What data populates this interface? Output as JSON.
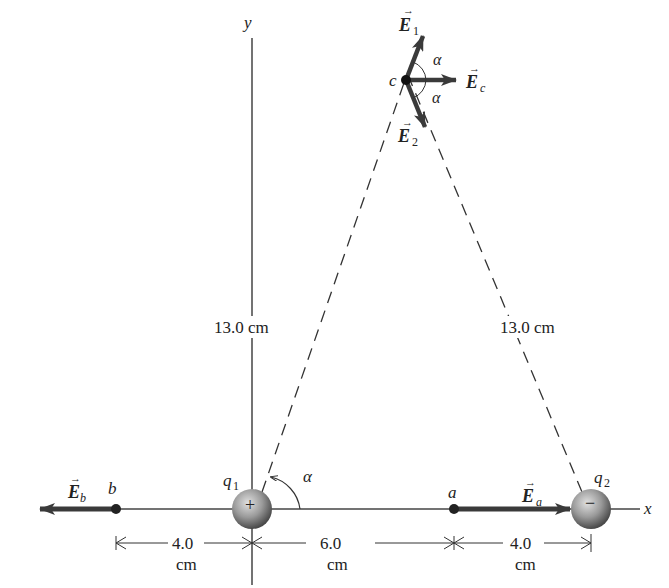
{
  "axes": {
    "x_label": "x",
    "y_label": "y"
  },
  "charges": {
    "q1": {
      "label": "q",
      "subscript": "1",
      "sign": "+"
    },
    "q2": {
      "label": "q",
      "subscript": "2",
      "sign": "−"
    }
  },
  "points": {
    "a": "a",
    "b": "b",
    "c": "c"
  },
  "vectors": {
    "E1": {
      "base": "E",
      "sub": "1"
    },
    "E2": {
      "base": "E",
      "sub": "2"
    },
    "Ec": {
      "base": "E",
      "sub": "c"
    },
    "Ea": {
      "base": "E",
      "sub": "a"
    },
    "Eb": {
      "base": "E",
      "sub": "b"
    },
    "arrow_glyph": "→"
  },
  "angles": {
    "alpha": "α"
  },
  "distances": {
    "left_dashed": "13.0 cm",
    "right_dashed": "13.0 cm",
    "b_to_q1_value": "4.0",
    "q1_to_a_value": "6.0",
    "a_to_q2_value": "4.0",
    "unit": "cm"
  },
  "colors": {
    "line": "#333333",
    "vector": "#3a3a3a",
    "sphere_light": "#d8d8d8",
    "sphere_dark": "#555555"
  }
}
